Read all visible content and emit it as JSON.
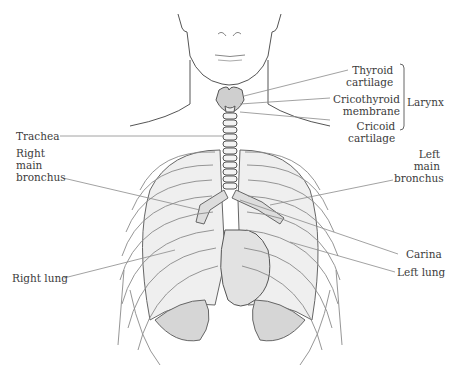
{
  "diagram": {
    "labels": {
      "thyroid_cartilage": [
        "Thyroid",
        "cartilage"
      ],
      "cricothyroid_membrane": [
        "Cricothyroid",
        "membrane"
      ],
      "cricoid_cartilage": [
        "Cricoid",
        "cartilage"
      ],
      "larynx": "Larynx",
      "trachea": "Trachea",
      "right_main_bronchus": [
        "Right",
        "main",
        "bronchus"
      ],
      "left_main_bronchus": [
        "Left",
        "main",
        "bronchus"
      ],
      "carina": "Carina",
      "right_lung": "Right lung",
      "left_lung": "Left lung"
    },
    "colors": {
      "line": "#555555",
      "leader": "#8a8a8a",
      "text": "#3c3c3c",
      "fill_light": "#ececec",
      "fill_mid": "#cfcfcf"
    }
  }
}
